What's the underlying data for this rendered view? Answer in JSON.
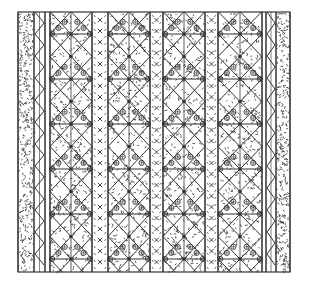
{
  "image": {
    "title": "Woven textile pattern with diamond motifs",
    "ink_color": "#333333",
    "background_color": "#ffffff"
  },
  "pattern": {
    "bounds": {
      "x": 18,
      "y": 12,
      "width": 272,
      "height": 260
    },
    "row_period": 45,
    "first_bar_y": 34,
    "diamond_columns": [
      {
        "x0": 50,
        "x1": 92
      },
      {
        "x0": 108,
        "x1": 150
      },
      {
        "x0": 163,
        "x1": 205
      },
      {
        "x0": 218,
        "x1": 262
      }
    ],
    "cross_strips": [
      {
        "x0": 92,
        "x1": 108
      },
      {
        "x0": 150,
        "x1": 163
      },
      {
        "x0": 205,
        "x1": 218
      }
    ],
    "zigzag_columns": [
      {
        "x0": 34,
        "x1": 45
      },
      {
        "x0": 266,
        "x1": 276
      }
    ],
    "textured_borders": [
      {
        "x0": 18,
        "x1": 34
      },
      {
        "x0": 276,
        "x1": 290
      }
    ]
  }
}
